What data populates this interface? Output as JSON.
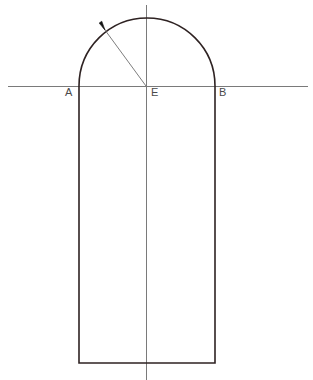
{
  "figure": {
    "background_color": "#ffffff",
    "width": 313,
    "height": 380,
    "labels": {
      "left_springing": "A",
      "center": "E",
      "right_springing": "B"
    },
    "colors": {
      "outline": "#2e2222",
      "construction_line": "#7a7a7a",
      "radius_line": "#6e6e6e",
      "arrowhead": "#141414",
      "label_text": "#4a4a4a"
    },
    "geometry": {
      "center_point": {
        "x": 146,
        "y": 86
      },
      "radius": 68,
      "left_wall_x": 79,
      "right_wall_x": 215,
      "springing_line_y": 86,
      "base_y": 363,
      "arch_apex_y": 18,
      "horizontal_line": {
        "x1": 8,
        "x2": 308,
        "y": 86
      },
      "vertical_axis": {
        "x": 146,
        "y1": 5,
        "y2": 380
      },
      "radius_arrow": {
        "x1": 146,
        "y1": 86,
        "x2": 105,
        "y2": 30
      }
    },
    "stroke_widths": {
      "outline": 1.6,
      "construction_line": 1,
      "radius_line": 0.9
    }
  },
  "chart_data": {
    "type": "diagram",
    "points": [
      {
        "name": "A",
        "role": "left springing point",
        "x": 79,
        "y": 86
      },
      {
        "name": "E",
        "role": "centre of arc on springing line",
        "x": 146,
        "y": 86
      },
      {
        "name": "B",
        "role": "right springing point",
        "x": 215,
        "y": 86
      }
    ],
    "measurements": {
      "span_AB": 136,
      "radius_EA": 68,
      "rise": 68,
      "jamb_height": 277,
      "total_height": 345
    },
    "annotations": [
      {
        "type": "arrow",
        "label": "radius",
        "from": "E",
        "to": "arc intrados",
        "angle_deg": 126
      }
    ],
    "xlabel": "",
    "ylabel": "",
    "grid": false,
    "legend": "none"
  }
}
